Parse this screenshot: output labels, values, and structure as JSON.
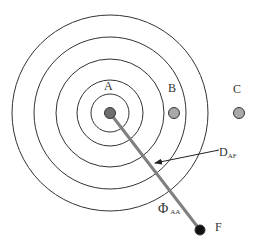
{
  "diagram": {
    "title": "",
    "center": {
      "x": 110,
      "y": 113
    },
    "rings": [
      19,
      33,
      54,
      76,
      98
    ],
    "nodes": [
      {
        "id": "A",
        "label": "A",
        "x": 110,
        "y": 113,
        "fill": "#6e6e6e",
        "label_x": 104,
        "label_y": 80
      },
      {
        "id": "B",
        "label": "B",
        "x": 174,
        "y": 113,
        "fill": "#a8a8a8",
        "label_x": 168,
        "label_y": 82
      },
      {
        "id": "C",
        "label": "C",
        "x": 239,
        "y": 113,
        "fill": "#a8a8a8",
        "label_x": 233,
        "label_y": 83
      },
      {
        "id": "F",
        "label": "F",
        "x": 200,
        "y": 230,
        "fill": "#111111",
        "label_x": 215,
        "label_y": 221
      }
    ],
    "edges": [
      {
        "from": "A",
        "to": "F",
        "label": "Φ",
        "label_sub": "AA",
        "color": "#808080"
      }
    ],
    "annotations": [
      {
        "label": "D",
        "label_sub": "AF",
        "x": 219,
        "y": 146,
        "arrow_from": [
          219,
          150
        ],
        "arrow_to": [
          155,
          163
        ]
      }
    ]
  }
}
